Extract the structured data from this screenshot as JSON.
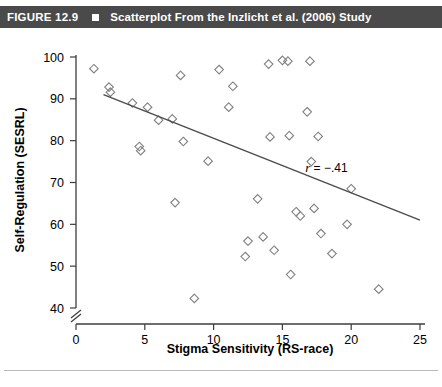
{
  "figure": {
    "number_label": "FIGURE 12.9",
    "bullet_icon": "filled-square-icon",
    "title": "Scatterplot From the Inzlicht et al. (2006) Study",
    "header_bg": "#4a4a4a",
    "header_fg": "#ffffff"
  },
  "chart_data": {
    "type": "scatter",
    "title": "Scatterplot From the Inzlicht et al. (2006) Study",
    "xlabel": "Stigma Sensitivity (RS-race)",
    "ylabel": "Self-Regulation (SESRL)",
    "xlim": [
      0,
      25
    ],
    "ylim": [
      40,
      100
    ],
    "xticks": [
      0,
      5,
      10,
      15,
      20,
      25
    ],
    "yticks": [
      40,
      50,
      60,
      70,
      80,
      90,
      100
    ],
    "grid": false,
    "legend": null,
    "y_axis_break": true,
    "y_axis_break_note": "double-slash break below 40",
    "marker": "open-diamond",
    "marker_color": "#808080",
    "point_count": 40,
    "points": [
      {
        "x": 1.3,
        "y": 97.2
      },
      {
        "x": 2.4,
        "y": 92.8
      },
      {
        "x": 2.5,
        "y": 91.6
      },
      {
        "x": 4.1,
        "y": 89.0
      },
      {
        "x": 4.6,
        "y": 78.6
      },
      {
        "x": 4.7,
        "y": 77.6
      },
      {
        "x": 5.2,
        "y": 88.0
      },
      {
        "x": 6.0,
        "y": 84.9
      },
      {
        "x": 7.0,
        "y": 85.2
      },
      {
        "x": 7.2,
        "y": 65.2
      },
      {
        "x": 7.6,
        "y": 95.6
      },
      {
        "x": 7.8,
        "y": 79.8
      },
      {
        "x": 8.6,
        "y": 42.3
      },
      {
        "x": 9.6,
        "y": 75.1
      },
      {
        "x": 10.4,
        "y": 97.0
      },
      {
        "x": 11.1,
        "y": 88.0
      },
      {
        "x": 11.4,
        "y": 93.0
      },
      {
        "x": 12.3,
        "y": 52.3
      },
      {
        "x": 12.5,
        "y": 56.0
      },
      {
        "x": 13.2,
        "y": 66.1
      },
      {
        "x": 13.6,
        "y": 57.0
      },
      {
        "x": 14.0,
        "y": 98.3
      },
      {
        "x": 14.1,
        "y": 80.9
      },
      {
        "x": 14.4,
        "y": 53.8
      },
      {
        "x": 15.0,
        "y": 99.2
      },
      {
        "x": 15.4,
        "y": 99.0
      },
      {
        "x": 15.5,
        "y": 81.2
      },
      {
        "x": 15.6,
        "y": 48.0
      },
      {
        "x": 16.0,
        "y": 63.0
      },
      {
        "x": 16.3,
        "y": 62.0
      },
      {
        "x": 16.8,
        "y": 86.9
      },
      {
        "x": 17.0,
        "y": 99.0
      },
      {
        "x": 17.1,
        "y": 75.0
      },
      {
        "x": 17.3,
        "y": 63.8
      },
      {
        "x": 17.6,
        "y": 81.0
      },
      {
        "x": 17.8,
        "y": 57.8
      },
      {
        "x": 18.6,
        "y": 53.0
      },
      {
        "x": 19.7,
        "y": 60.0
      },
      {
        "x": 20.0,
        "y": 68.5
      },
      {
        "x": 22.0,
        "y": 44.5
      }
    ],
    "trendline": {
      "label": "r = −.41",
      "label_r": "r",
      "label_rest": " = −.41",
      "correlation": -0.41,
      "x_start": 2.0,
      "y_start": 91.0,
      "x_end": 25.0,
      "y_end": 61.0,
      "color": "#4d4d4d"
    },
    "annotations": [
      {
        "text": "r = −.41",
        "x": 18.2,
        "y": 72.5
      }
    ]
  }
}
